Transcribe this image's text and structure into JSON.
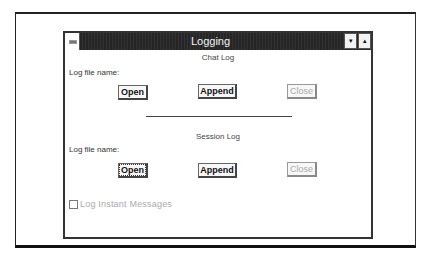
{
  "window": {
    "title": "Logging",
    "controls": {
      "system_menu": "system-menu",
      "minimize": "▾",
      "maximize": "▴"
    }
  },
  "chat_log": {
    "section_title": "Chat Log",
    "file_label": "Log file name:",
    "buttons": {
      "open": "Open",
      "append": "Append",
      "close": "Close"
    },
    "close_enabled": false
  },
  "session_log": {
    "section_title": "Session Log",
    "file_label": "Log file name:",
    "buttons": {
      "open": "Open",
      "append": "Append",
      "close": "Close"
    },
    "close_enabled": false,
    "focused_button": "open"
  },
  "instant_messages": {
    "label": "Log Instant Messages",
    "checked": false,
    "enabled": false
  }
}
